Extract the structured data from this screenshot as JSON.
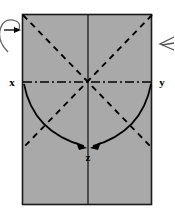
{
  "figure": {
    "type": "fold-diagram",
    "width": 175,
    "height": 218,
    "background_color": "#ffffff",
    "sheet": {
      "name": "rectangular-sheet",
      "fill_color": "#a9a9a9",
      "stroke_color": "#1a1a1a",
      "x": 22,
      "y": 14,
      "width": 130,
      "height": 191
    },
    "center_point": {
      "x": 88,
      "y": 82
    }
  },
  "labels": {
    "x_axis": "x",
    "y_axis": "y",
    "z_axis": "z"
  },
  "lines": {
    "horizontal_axis": {
      "name": "x-y-axis",
      "style": "dash-dot",
      "color": "#000000",
      "x1": 24,
      "y1": 82,
      "x2": 152,
      "y2": 82
    },
    "vertical_center": {
      "name": "vertical-center-line",
      "style": "solid",
      "color": "#000000",
      "x1": 88,
      "y1": 14,
      "x2": 88,
      "y2": 205
    },
    "diagonal_down_right": {
      "name": "fold-crease-diagonal-1",
      "style": "dashed",
      "color": "#000000",
      "x1": 23,
      "y1": 15,
      "x2": 152,
      "y2": 148
    },
    "diagonal_down_left": {
      "name": "fold-crease-diagonal-2",
      "style": "dashed",
      "color": "#000000",
      "x1": 152,
      "y1": 15,
      "x2": 23,
      "y2": 148
    }
  },
  "arrows": {
    "fold_left": {
      "name": "fold-arrow-left",
      "description": "curved arrow from x end sweeping down to z",
      "start": {
        "x": 24,
        "y": 84
      },
      "control": {
        "x": 36,
        "y": 134
      },
      "end": {
        "x": 85,
        "y": 148
      }
    },
    "fold_right": {
      "name": "fold-arrow-right",
      "description": "curved arrow from y end sweeping down to z",
      "start": {
        "x": 151,
        "y": 84
      },
      "control": {
        "x": 139,
        "y": 134
      },
      "end": {
        "x": 92,
        "y": 148
      }
    },
    "rotation_left": {
      "name": "rotation-arrow-left",
      "description": "partial circular rotation arrow at left edge pointing right",
      "tip": {
        "x": 19,
        "y": 30
      }
    },
    "rotation_right": {
      "name": "rotation-arrow-right",
      "description": "partial arrowhead chevron at right edge pointing left",
      "tip": {
        "x": 160,
        "y": 44
      }
    }
  },
  "colors": {
    "sheet_gray": "#a9a9a9",
    "ink_black": "#000000",
    "border_dark": "#1a1a1a",
    "page_white": "#ffffff"
  }
}
